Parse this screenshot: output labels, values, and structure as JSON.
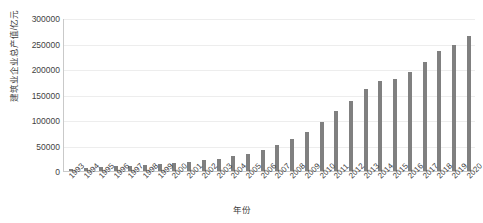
{
  "chart_data": {
    "type": "bar",
    "title": "",
    "xlabel": "年份",
    "ylabel": "建筑业企业总产值/亿元",
    "ylim": [
      0,
      300000
    ],
    "grid": true,
    "legend": false,
    "bar_color": "#808080",
    "axis_color": "#c9c9c9",
    "gridline_color": "#ededed",
    "y_ticks": [
      0,
      50000,
      100000,
      150000,
      200000,
      250000,
      300000
    ],
    "y_tick_labels": [
      "0",
      "50000",
      "100000",
      "150000",
      "200000",
      "250000",
      "300000"
    ],
    "categories": [
      "1993",
      "1994",
      "1995",
      "1996",
      "1997",
      "1998",
      "1999",
      "2000",
      "2001",
      "2002",
      "2003",
      "2004",
      "2005",
      "2006",
      "2007",
      "2008",
      "2009",
      "2010",
      "2011",
      "2012",
      "2013",
      "2014",
      "2015",
      "2016",
      "2017",
      "2018",
      "2019",
      "2020"
    ],
    "values": [
      4500,
      6000,
      7500,
      9000,
      10500,
      12000,
      13500,
      15000,
      18000,
      21000,
      24000,
      29000,
      34000,
      41000,
      51000,
      62000,
      77000,
      96000,
      117000,
      137000,
      160000,
      177000,
      180000,
      194000,
      214000,
      235000,
      248000,
      264000
    ],
    "units": "亿元"
  }
}
